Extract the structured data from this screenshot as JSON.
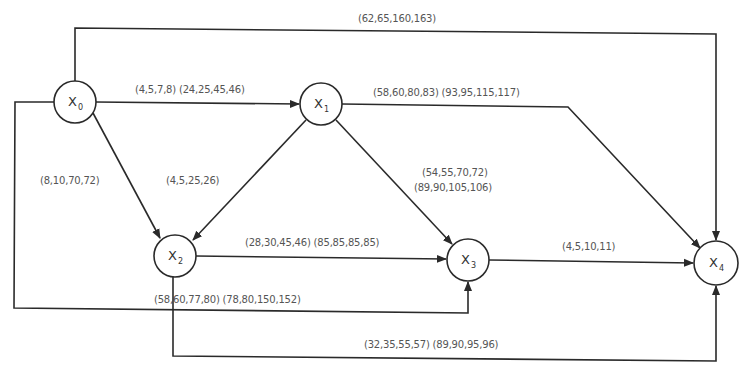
{
  "diagram": {
    "type": "project-network",
    "nodes": [
      {
        "id": "X0",
        "base": "X",
        "sub": "0",
        "cx": 75,
        "cy": 102,
        "r": 21
      },
      {
        "id": "X1",
        "base": "X",
        "sub": "1",
        "cx": 321,
        "cy": 104,
        "r": 21
      },
      {
        "id": "X2",
        "base": "X",
        "sub": "2",
        "cx": 175,
        "cy": 256,
        "r": 21
      },
      {
        "id": "X3",
        "base": "X",
        "sub": "3",
        "cx": 468,
        "cy": 260,
        "r": 21
      },
      {
        "id": "X4",
        "base": "X",
        "sub": "4",
        "cx": 716,
        "cy": 263,
        "r": 22
      }
    ],
    "edges": [
      {
        "from": "X0",
        "to": "X4",
        "label": "(62,65,160,163)"
      },
      {
        "from": "X0",
        "to": "X1",
        "label": "(4,5,7,8) (24,25,45,46)"
      },
      {
        "from": "X1",
        "to": "X4",
        "label": "(58,60,80,83) (93,95,115,117)"
      },
      {
        "from": "X0",
        "to": "X2",
        "label": "(8,10,70,72)"
      },
      {
        "from": "X1",
        "to": "X2",
        "label": "(4,5,25,26)"
      },
      {
        "from": "X1",
        "to": "X3",
        "label_line1": "(54,55,70,72)",
        "label_line2": "(89,90,105,106)"
      },
      {
        "from": "X2",
        "to": "X3",
        "label": "(28,30,45,46) (85,85,85,85)"
      },
      {
        "from": "X3",
        "to": "X4",
        "label": "(4,5,10,11)"
      },
      {
        "from": "X0",
        "to": "X3",
        "label": "(58,60,77,80) (78,80,150,152)"
      },
      {
        "from": "X2",
        "to": "X4",
        "label": "(32,35,55,57) (89,90,95,96)"
      }
    ],
    "colors": {
      "line": "#2a2a2a",
      "text": "#555555",
      "background": "#ffffff"
    }
  }
}
